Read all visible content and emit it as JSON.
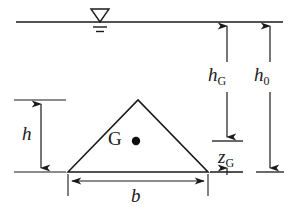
{
  "figure": {
    "stroke_color": "#1a1a1a",
    "background_color": "#ffffff"
  },
  "labels": {
    "height": {
      "base": "h",
      "sub": ""
    },
    "width": {
      "base": "b",
      "sub": ""
    },
    "depth_to_centroid": {
      "base": "h",
      "sub": "G"
    },
    "total_depth": {
      "base": "h",
      "sub": "0"
    },
    "centroid_offset": {
      "base": "z",
      "sub": "G"
    },
    "centroid_point": {
      "base": "G",
      "sub": ""
    }
  },
  "geometry": {
    "water_line_y": 22,
    "water_line_x_start": 16,
    "water_line_x_end": 283,
    "triangle": {
      "left_vertex": [
        68,
        172
      ],
      "apex": [
        138,
        100
      ],
      "right_vertex": [
        208,
        172
      ]
    },
    "centroid_dot": [
      136,
      141
    ],
    "h_dimension_x": 41,
    "h_dimension_top_y": 100,
    "h_dimension_bottom_y": 172,
    "b_dimension_y": 181,
    "b_dimension_left_x": 68,
    "b_dimension_right_x": 208,
    "hG_dimension_x": 227,
    "hG_bottom_y": 141,
    "h0_dimension_x": 270,
    "h0_bottom_y": 172,
    "zG_top_y": 141,
    "zG_bottom_y": 172
  },
  "icons": {
    "water_surface": "water-level-triangle-icon"
  }
}
